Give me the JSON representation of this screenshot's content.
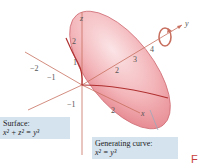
{
  "figure": {
    "surface_label": {
      "title": "Surface:",
      "equation": "x² + z² = y³"
    },
    "curve_label": {
      "title": "Generating curve:",
      "equation": "x² = y³"
    },
    "axes": {
      "x": {
        "name": "x",
        "ticks": [
          "2"
        ]
      },
      "y": {
        "name": "y",
        "ticks": [
          "2",
          "3",
          "4"
        ]
      },
      "z": {
        "name": "z",
        "ticks": [
          "2",
          "1",
          "−1"
        ]
      },
      "neg_x": {
        "ticks": [
          "−2",
          "−1"
        ]
      }
    },
    "colors": {
      "surface": "#f0a0a5",
      "curve": "#b03030",
      "axis": "#c87060",
      "label_box": "#d5e3ef"
    },
    "rotation_icon": "rotation-arrow-icon",
    "edge_fragment": "F"
  }
}
